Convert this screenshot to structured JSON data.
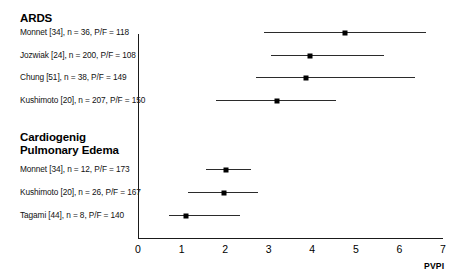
{
  "chart_data": {
    "type": "scatter",
    "title": "",
    "xlabel": "PVPI",
    "ylabel": "",
    "xlim": [
      0,
      7
    ],
    "xticks": [
      0,
      1,
      2,
      3,
      4,
      5,
      6,
      7
    ],
    "xtick_labels": [
      "0",
      "1",
      "2",
      "3",
      "4",
      "5",
      "6",
      "7"
    ],
    "grid": false,
    "legend": "none",
    "orientation": "horizontal-forest-plot",
    "groups": [
      {
        "name": "ARDS",
        "rows": [
          {
            "label": "Monnet [34], n = 36, P/F = 118",
            "author": "Monnet",
            "reference": "34",
            "n": 36,
            "pf_ratio": 118,
            "value": 4.75,
            "ci_low": 2.9,
            "ci_high": 6.6
          },
          {
            "label": "Jozwiak [24], n = 200, P/F = 108",
            "author": "Jozwiak",
            "reference": "24",
            "n": 200,
            "pf_ratio": 108,
            "value": 3.95,
            "ci_low": 3.05,
            "ci_high": 5.65
          },
          {
            "label": "Chung [51], n = 38, P/F = 149",
            "author": "Chung",
            "reference": "51",
            "n": 38,
            "pf_ratio": 149,
            "value": 3.85,
            "ci_low": 2.7,
            "ci_high": 6.35
          },
          {
            "label": "Kushimoto [20], n = 207, P/F = 150",
            "author": "Kushimoto",
            "reference": "20",
            "n": 207,
            "pf_ratio": 150,
            "value": 3.2,
            "ci_low": 1.8,
            "ci_high": 4.55
          }
        ]
      },
      {
        "name": "Cardiogenig\nPulmonary Edema",
        "rows": [
          {
            "label": "Monnet [34], n = 12, P/F = 173",
            "author": "Monnet",
            "reference": "34",
            "n": 12,
            "pf_ratio": 173,
            "value": 2.02,
            "ci_low": 1.57,
            "ci_high": 2.6
          },
          {
            "label": "Kushimoto [20], n = 26, P/F = 167",
            "author": "Kushimoto",
            "reference": "20",
            "n": 26,
            "pf_ratio": 167,
            "value": 1.98,
            "ci_low": 1.15,
            "ci_high": 2.76
          },
          {
            "label": "Tagami [44], n = 8, P/F = 140",
            "author": "Tagami",
            "reference": "44",
            "n": 8,
            "pf_ratio": 140,
            "value": 1.1,
            "ci_low": 0.7,
            "ci_high": 2.35
          }
        ]
      }
    ]
  },
  "layout": {
    "axis_x0_px": 138,
    "axis_x7_px": 443,
    "axis_top_px": 34,
    "axis_bottom_px": 238,
    "label_left_px": 20,
    "row_y_px": [
      32,
      55,
      77,
      100,
      169,
      192,
      215
    ],
    "group_title_y_px": [
      12,
      133
    ],
    "group_label_y_px": [
      [
        28,
        51,
        73,
        96
      ],
      [
        165,
        188,
        211
      ]
    ]
  },
  "colors": {
    "axis": "#1a1a1a",
    "marker": "#000000",
    "ci": "#2b2b2b",
    "text": "#000000",
    "background": "#ffffff"
  }
}
